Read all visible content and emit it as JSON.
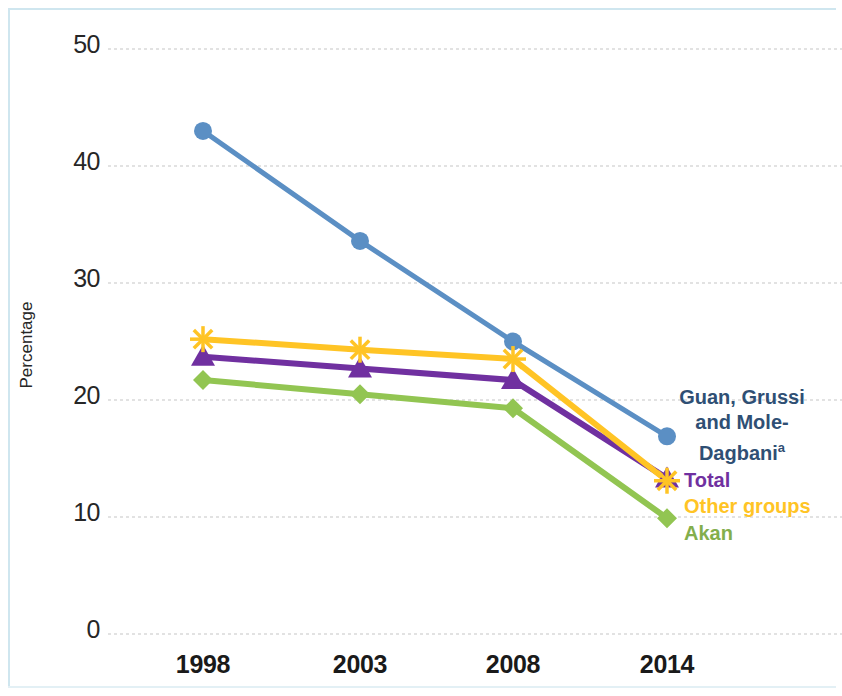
{
  "chart_data": {
    "type": "line",
    "title": "",
    "xlabel": "",
    "ylabel": "Percentage",
    "x": [
      "1998",
      "2003",
      "2008",
      "2014"
    ],
    "categories": [
      "1998",
      "2003",
      "2008",
      "2014"
    ],
    "ylim": [
      0,
      50
    ],
    "yticks": [
      "0",
      "10",
      "20",
      "30",
      "40",
      "50"
    ],
    "ytick_values": [
      0,
      10,
      20,
      30,
      40,
      50
    ],
    "grid": "horizontal-dotted",
    "legend_position": "right-inline",
    "series": [
      {
        "name": "Guan, Grussi and Mole-Dagbani",
        "legend_label": "Guan, Grussi\nand Mole-\nDagbani",
        "footnote_marker": "a",
        "marker": "circle",
        "color": "#5b8fc4",
        "values": [
          43.0,
          33.6,
          25.0,
          16.9
        ]
      },
      {
        "name": "Total",
        "legend_label": "Total",
        "marker": "triangle",
        "color": "#7030a0",
        "values": [
          23.7,
          22.7,
          21.7,
          13.3
        ]
      },
      {
        "name": "Other groups",
        "legend_label": "Other groups",
        "marker": "star",
        "color": "#ffc425",
        "values": [
          25.2,
          24.3,
          23.5,
          13.1
        ]
      },
      {
        "name": "Akan",
        "legend_label": "Akan",
        "marker": "diamond",
        "color": "#92c552",
        "values": [
          21.7,
          20.5,
          19.3,
          9.9
        ]
      }
    ]
  },
  "axis": {
    "y_title": "Percentage",
    "y_ticks": [
      "50",
      "40",
      "30",
      "20",
      "10",
      "0"
    ],
    "x_ticks": [
      "1998",
      "2003",
      "2008",
      "2014"
    ]
  },
  "legend": {
    "guan_line1": "Guan, Grussi",
    "guan_line2": "and Mole-",
    "guan_line3": "Dagbani",
    "guan_superscript": "a",
    "total": "Total",
    "other_groups": "Other groups",
    "akan": "Akan"
  },
  "colors": {
    "guan": "#5b8fc4",
    "total": "#7030a0",
    "other_groups": "#ffc425",
    "akan": "#92c552",
    "gridline": "#d9d9d9",
    "frame": "#cfe6ef"
  }
}
